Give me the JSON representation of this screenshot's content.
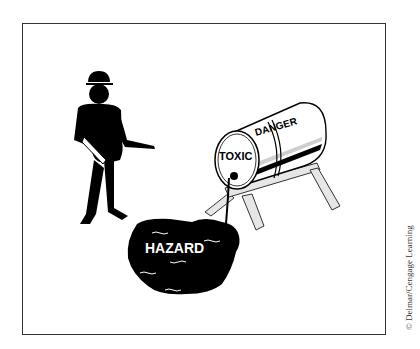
{
  "illustration": {
    "description": "Worker standing near a toxic barrel on a sawhorse leaking into a hazard puddle",
    "barrel": {
      "end_label": "TOXIC",
      "side_label": "DANGER"
    },
    "puddle": {
      "label": "HAZARD"
    }
  },
  "credit": "© Delmar/Cengage Learning",
  "colors": {
    "ink": "#000000",
    "frame": "#333333",
    "sawhorse_fill": "#e6e6e6",
    "barrel_stripe_light": "#cfcfcf"
  }
}
